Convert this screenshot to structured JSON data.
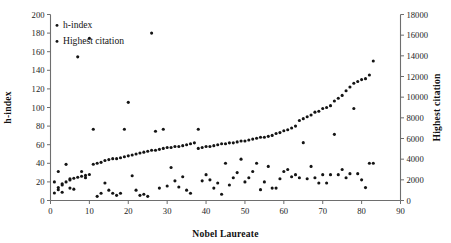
{
  "chart_data": {
    "type": "scatter",
    "title": "",
    "xlabel": "Nobel Laureate",
    "ylabel": "h-index",
    "y2label": "Highest citation",
    "xlim": [
      0,
      90
    ],
    "ylim": [
      0,
      200
    ],
    "y2lim": [
      0,
      18000
    ],
    "xticks": [
      0,
      10,
      20,
      30,
      40,
      50,
      60,
      70,
      80,
      90
    ],
    "yticks": [
      0,
      20,
      40,
      60,
      80,
      100,
      120,
      140,
      160,
      180,
      200
    ],
    "y2ticks": [
      0,
      2000,
      4000,
      6000,
      8000,
      10000,
      12000,
      14000,
      16000,
      18000
    ],
    "grid": false,
    "legend_position": "top-left",
    "marker": "circle",
    "marker_color": "#141414",
    "series": [
      {
        "name": "h-index",
        "axis": "left",
        "x": [
          1,
          2,
          3,
          4,
          5,
          6,
          7,
          8,
          9,
          10,
          11,
          12,
          13,
          14,
          15,
          16,
          17,
          18,
          19,
          20,
          21,
          22,
          23,
          24,
          25,
          26,
          27,
          28,
          29,
          30,
          31,
          32,
          33,
          34,
          35,
          36,
          37,
          38,
          39,
          40,
          41,
          42,
          43,
          44,
          45,
          46,
          47,
          48,
          49,
          50,
          51,
          52,
          53,
          54,
          55,
          56,
          57,
          58,
          59,
          60,
          61,
          62,
          63,
          64,
          65,
          66,
          67,
          68,
          69,
          70,
          71,
          72,
          73,
          74,
          75,
          76,
          77,
          78,
          79,
          80,
          81,
          82,
          83
        ],
        "values": [
          8,
          14,
          18,
          20,
          22,
          24,
          25,
          26,
          27,
          28,
          39,
          40,
          41,
          43,
          44,
          45,
          45,
          46,
          47,
          48,
          49,
          50,
          51,
          52,
          53,
          54,
          54,
          55,
          56,
          57,
          57,
          58,
          58,
          59,
          60,
          61,
          62,
          56,
          57,
          58,
          58,
          59,
          60,
          61,
          61,
          62,
          62,
          63,
          64,
          64,
          65,
          66,
          67,
          68,
          68,
          69,
          70,
          72,
          73,
          75,
          76,
          78,
          80,
          86,
          88,
          90,
          92,
          95,
          96,
          99,
          100,
          102,
          107,
          110,
          113,
          118,
          122,
          126,
          128,
          130,
          131,
          135,
          150
        ]
      },
      {
        "name": "Highest citation",
        "axis": "right",
        "x": [
          1,
          2,
          2,
          3,
          3,
          4,
          5,
          5,
          6,
          7,
          8,
          9,
          10,
          11,
          12,
          13,
          14,
          15,
          16,
          17,
          18,
          19,
          20,
          21,
          22,
          23,
          24,
          25,
          26,
          27,
          28,
          29,
          30,
          31,
          32,
          33,
          34,
          35,
          36,
          38,
          39,
          40,
          41,
          42,
          43,
          44,
          45,
          46,
          47,
          48,
          49,
          50,
          51,
          52,
          53,
          54,
          55,
          56,
          57,
          58,
          59,
          60,
          61,
          62,
          63,
          64,
          65,
          66,
          67,
          68,
          69,
          70,
          71,
          72,
          73,
          74,
          75,
          76,
          77,
          78,
          79,
          80,
          81,
          82,
          83
        ],
        "values": [
          1800,
          2800,
          1050,
          1500,
          800,
          3500,
          2100,
          1200,
          1100,
          13900,
          2800,
          2200,
          15700,
          6900,
          400,
          700,
          1700,
          1000,
          700,
          500,
          700,
          6900,
          9500,
          2400,
          1000,
          500,
          600,
          400,
          16200,
          6700,
          1200,
          6900,
          1400,
          3200,
          1900,
          1300,
          2300,
          1000,
          700,
          6900,
          1900,
          2500,
          2000,
          1200,
          1700,
          600,
          3600,
          1500,
          2200,
          2700,
          4000,
          1800,
          2200,
          2800,
          3600,
          1050,
          1800,
          3300,
          1200,
          1200,
          2100,
          2800,
          3000,
          2300,
          2500,
          2200,
          5600,
          2100,
          3300,
          2200,
          1700,
          2500,
          1700,
          2500,
          6400,
          2500,
          3000,
          2200,
          2600,
          8900,
          2600,
          2000,
          1250,
          3600,
          3600
        ]
      }
    ]
  },
  "legend": {
    "items": [
      {
        "label": "h-index"
      },
      {
        "label": "Highest citation"
      }
    ]
  },
  "axes": {
    "x_title": "Nobel Laureate",
    "y_left_title": "h-index",
    "y_right_title": "Highest citation"
  }
}
